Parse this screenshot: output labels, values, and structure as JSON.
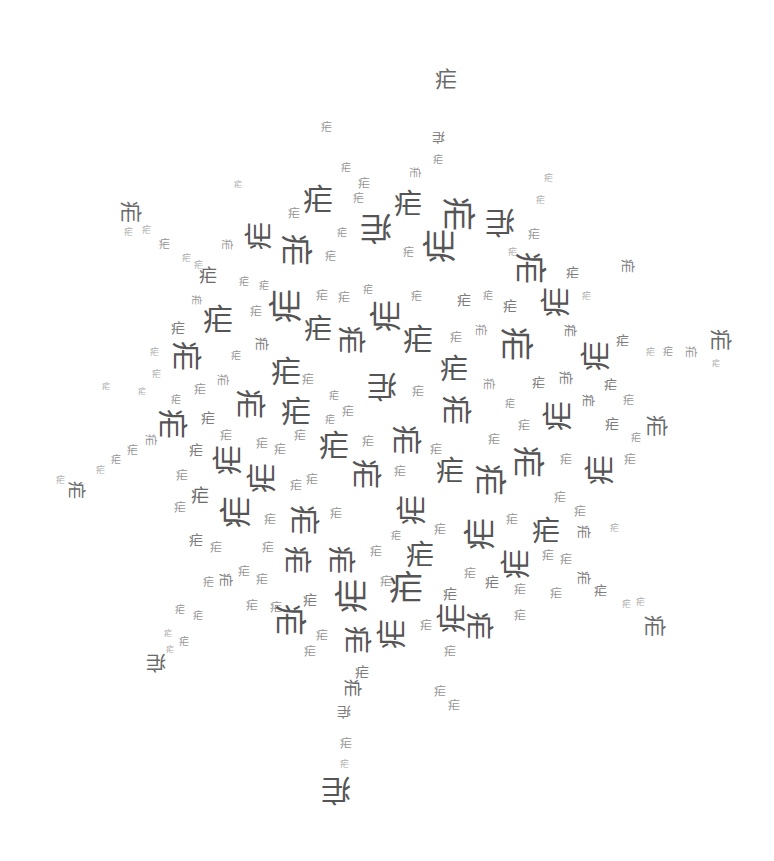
{
  "artwork": {
    "description": "Word-cloud style arrangement of a single repeated Chinese character in a roughly circular cluster with radial spokes",
    "character": "疟",
    "background_color": "#ffffff",
    "ink_colors": [
      "#555555",
      "#6a6a6a",
      "#7d7d7d",
      "#959595",
      "#aaaaaa"
    ]
  },
  "glyphs": [
    {
      "x": 446,
      "y": 80,
      "s": 22,
      "r": 0
    },
    {
      "x": 326,
      "y": 127,
      "s": 11,
      "r": 0
    },
    {
      "x": 438,
      "y": 137,
      "s": 13,
      "r": 180
    },
    {
      "x": 438,
      "y": 160,
      "s": 10,
      "r": 0
    },
    {
      "x": 414,
      "y": 172,
      "s": 11,
      "r": 90
    },
    {
      "x": 346,
      "y": 168,
      "s": 10,
      "r": 0
    },
    {
      "x": 364,
      "y": 184,
      "s": 12,
      "r": 0
    },
    {
      "x": 408,
      "y": 205,
      "s": 28,
      "r": 0
    },
    {
      "x": 358,
      "y": 198,
      "s": 11,
      "r": 0
    },
    {
      "x": 458,
      "y": 214,
      "s": 34,
      "r": 90
    },
    {
      "x": 500,
      "y": 222,
      "s": 30,
      "r": 180
    },
    {
      "x": 548,
      "y": 178,
      "s": 9,
      "r": 0
    },
    {
      "x": 540,
      "y": 200,
      "s": 9,
      "r": 0
    },
    {
      "x": 534,
      "y": 235,
      "s": 12,
      "r": 0
    },
    {
      "x": 130,
      "y": 212,
      "s": 22,
      "r": 90
    },
    {
      "x": 128,
      "y": 232,
      "s": 9,
      "r": 0
    },
    {
      "x": 146,
      "y": 230,
      "s": 9,
      "r": 0
    },
    {
      "x": 164,
      "y": 244,
      "s": 11,
      "r": 0
    },
    {
      "x": 186,
      "y": 258,
      "s": 9,
      "r": 0
    },
    {
      "x": 198,
      "y": 265,
      "s": 9,
      "r": 0
    },
    {
      "x": 238,
      "y": 185,
      "s": 8,
      "r": 0
    },
    {
      "x": 318,
      "y": 200,
      "s": 30,
      "r": 0
    },
    {
      "x": 294,
      "y": 214,
      "s": 12,
      "r": 0
    },
    {
      "x": 260,
      "y": 236,
      "s": 28,
      "r": 270
    },
    {
      "x": 342,
      "y": 233,
      "s": 10,
      "r": 0
    },
    {
      "x": 376,
      "y": 228,
      "s": 32,
      "r": 180
    },
    {
      "x": 330,
      "y": 256,
      "s": 11,
      "r": 0
    },
    {
      "x": 296,
      "y": 250,
      "s": 32,
      "r": 90
    },
    {
      "x": 226,
      "y": 244,
      "s": 11,
      "r": 90
    },
    {
      "x": 440,
      "y": 246,
      "s": 34,
      "r": 270
    },
    {
      "x": 408,
      "y": 252,
      "s": 11,
      "r": 0
    },
    {
      "x": 530,
      "y": 268,
      "s": 32,
      "r": 90
    },
    {
      "x": 512,
      "y": 252,
      "s": 9,
      "r": 0
    },
    {
      "x": 572,
      "y": 272,
      "s": 13,
      "r": 0
    },
    {
      "x": 628,
      "y": 266,
      "s": 14,
      "r": 90
    },
    {
      "x": 208,
      "y": 276,
      "s": 18,
      "r": 0
    },
    {
      "x": 244,
      "y": 282,
      "s": 10,
      "r": 0
    },
    {
      "x": 264,
      "y": 286,
      "s": 10,
      "r": 0
    },
    {
      "x": 196,
      "y": 300,
      "s": 10,
      "r": 90
    },
    {
      "x": 218,
      "y": 320,
      "s": 30,
      "r": 0
    },
    {
      "x": 178,
      "y": 328,
      "s": 14,
      "r": 0
    },
    {
      "x": 256,
      "y": 312,
      "s": 12,
      "r": 0
    },
    {
      "x": 286,
      "y": 306,
      "s": 34,
      "r": 270
    },
    {
      "x": 322,
      "y": 296,
      "s": 12,
      "r": 0
    },
    {
      "x": 344,
      "y": 298,
      "s": 12,
      "r": 0
    },
    {
      "x": 368,
      "y": 290,
      "s": 10,
      "r": 0
    },
    {
      "x": 386,
      "y": 316,
      "s": 32,
      "r": 270
    },
    {
      "x": 416,
      "y": 296,
      "s": 11,
      "r": 0
    },
    {
      "x": 464,
      "y": 300,
      "s": 14,
      "r": 0
    },
    {
      "x": 488,
      "y": 296,
      "s": 10,
      "r": 0
    },
    {
      "x": 510,
      "y": 306,
      "s": 14,
      "r": 0
    },
    {
      "x": 556,
      "y": 302,
      "s": 30,
      "r": 270
    },
    {
      "x": 586,
      "y": 296,
      "s": 9,
      "r": 0
    },
    {
      "x": 570,
      "y": 330,
      "s": 13,
      "r": 90
    },
    {
      "x": 318,
      "y": 330,
      "s": 28,
      "r": 0
    },
    {
      "x": 350,
      "y": 340,
      "s": 28,
      "r": 90
    },
    {
      "x": 262,
      "y": 344,
      "s": 14,
      "r": 90
    },
    {
      "x": 236,
      "y": 356,
      "s": 10,
      "r": 0
    },
    {
      "x": 418,
      "y": 340,
      "s": 30,
      "r": 0
    },
    {
      "x": 456,
      "y": 338,
      "s": 12,
      "r": 0
    },
    {
      "x": 480,
      "y": 330,
      "s": 12,
      "r": 90
    },
    {
      "x": 516,
      "y": 344,
      "s": 34,
      "r": 90
    },
    {
      "x": 596,
      "y": 356,
      "s": 30,
      "r": 270
    },
    {
      "x": 622,
      "y": 340,
      "s": 13,
      "r": 0
    },
    {
      "x": 650,
      "y": 352,
      "s": 9,
      "r": 0
    },
    {
      "x": 668,
      "y": 352,
      "s": 10,
      "r": 0
    },
    {
      "x": 690,
      "y": 352,
      "s": 12,
      "r": 90
    },
    {
      "x": 720,
      "y": 340,
      "s": 22,
      "r": 90
    },
    {
      "x": 716,
      "y": 364,
      "s": 8,
      "r": 0
    },
    {
      "x": 186,
      "y": 356,
      "s": 30,
      "r": 90
    },
    {
      "x": 154,
      "y": 352,
      "s": 9,
      "r": 0
    },
    {
      "x": 156,
      "y": 374,
      "s": 9,
      "r": 0
    },
    {
      "x": 176,
      "y": 400,
      "s": 10,
      "r": 0
    },
    {
      "x": 200,
      "y": 390,
      "s": 12,
      "r": 0
    },
    {
      "x": 222,
      "y": 380,
      "s": 12,
      "r": 90
    },
    {
      "x": 286,
      "y": 372,
      "s": 30,
      "r": 0
    },
    {
      "x": 308,
      "y": 380,
      "s": 12,
      "r": 0
    },
    {
      "x": 250,
      "y": 404,
      "s": 30,
      "r": 90
    },
    {
      "x": 334,
      "y": 396,
      "s": 10,
      "r": 0
    },
    {
      "x": 382,
      "y": 386,
      "s": 30,
      "r": 180
    },
    {
      "x": 454,
      "y": 370,
      "s": 28,
      "r": 0
    },
    {
      "x": 418,
      "y": 392,
      "s": 12,
      "r": 0
    },
    {
      "x": 488,
      "y": 384,
      "s": 12,
      "r": 90
    },
    {
      "x": 538,
      "y": 382,
      "s": 13,
      "r": 0
    },
    {
      "x": 566,
      "y": 378,
      "s": 14,
      "r": 90
    },
    {
      "x": 588,
      "y": 400,
      "s": 13,
      "r": 90
    },
    {
      "x": 610,
      "y": 384,
      "s": 13,
      "r": 0
    },
    {
      "x": 628,
      "y": 400,
      "s": 11,
      "r": 0
    },
    {
      "x": 106,
      "y": 387,
      "s": 8,
      "r": 0
    },
    {
      "x": 142,
      "y": 392,
      "s": 8,
      "r": 0
    },
    {
      "x": 172,
      "y": 424,
      "s": 30,
      "r": 90
    },
    {
      "x": 208,
      "y": 418,
      "s": 14,
      "r": 0
    },
    {
      "x": 226,
      "y": 436,
      "s": 12,
      "r": 0
    },
    {
      "x": 296,
      "y": 412,
      "s": 30,
      "r": 0
    },
    {
      "x": 330,
      "y": 420,
      "s": 10,
      "r": 0
    },
    {
      "x": 348,
      "y": 412,
      "s": 12,
      "r": 0
    },
    {
      "x": 456,
      "y": 410,
      "s": 30,
      "r": 90
    },
    {
      "x": 510,
      "y": 404,
      "s": 10,
      "r": 0
    },
    {
      "x": 524,
      "y": 426,
      "s": 12,
      "r": 0
    },
    {
      "x": 558,
      "y": 416,
      "s": 30,
      "r": 270
    },
    {
      "x": 612,
      "y": 424,
      "s": 14,
      "r": 0
    },
    {
      "x": 636,
      "y": 438,
      "s": 10,
      "r": 0
    },
    {
      "x": 656,
      "y": 426,
      "s": 22,
      "r": 90
    },
    {
      "x": 196,
      "y": 450,
      "s": 14,
      "r": 0
    },
    {
      "x": 150,
      "y": 440,
      "s": 12,
      "r": 90
    },
    {
      "x": 132,
      "y": 450,
      "s": 11,
      "r": 0
    },
    {
      "x": 116,
      "y": 460,
      "s": 10,
      "r": 0
    },
    {
      "x": 100,
      "y": 470,
      "s": 9,
      "r": 0
    },
    {
      "x": 60,
      "y": 480,
      "s": 9,
      "r": 0
    },
    {
      "x": 76,
      "y": 490,
      "s": 18,
      "r": 90
    },
    {
      "x": 228,
      "y": 460,
      "s": 30,
      "r": 270
    },
    {
      "x": 262,
      "y": 444,
      "s": 12,
      "r": 0
    },
    {
      "x": 280,
      "y": 450,
      "s": 12,
      "r": 0
    },
    {
      "x": 300,
      "y": 436,
      "s": 12,
      "r": 0
    },
    {
      "x": 334,
      "y": 446,
      "s": 30,
      "r": 0
    },
    {
      "x": 368,
      "y": 442,
      "s": 12,
      "r": 0
    },
    {
      "x": 406,
      "y": 440,
      "s": 30,
      "r": 90
    },
    {
      "x": 436,
      "y": 450,
      "s": 12,
      "r": 0
    },
    {
      "x": 494,
      "y": 440,
      "s": 12,
      "r": 0
    },
    {
      "x": 528,
      "y": 462,
      "s": 32,
      "r": 90
    },
    {
      "x": 566,
      "y": 460,
      "s": 12,
      "r": 0
    },
    {
      "x": 600,
      "y": 470,
      "s": 30,
      "r": 270
    },
    {
      "x": 630,
      "y": 460,
      "s": 12,
      "r": 0
    },
    {
      "x": 182,
      "y": 476,
      "s": 12,
      "r": 0
    },
    {
      "x": 200,
      "y": 496,
      "s": 18,
      "r": 0
    },
    {
      "x": 262,
      "y": 478,
      "s": 30,
      "r": 270
    },
    {
      "x": 296,
      "y": 486,
      "s": 12,
      "r": 0
    },
    {
      "x": 312,
      "y": 480,
      "s": 12,
      "r": 0
    },
    {
      "x": 366,
      "y": 474,
      "s": 30,
      "r": 90
    },
    {
      "x": 400,
      "y": 472,
      "s": 12,
      "r": 0
    },
    {
      "x": 450,
      "y": 472,
      "s": 28,
      "r": 0
    },
    {
      "x": 490,
      "y": 480,
      "s": 32,
      "r": 90
    },
    {
      "x": 560,
      "y": 498,
      "s": 12,
      "r": 0
    },
    {
      "x": 580,
      "y": 512,
      "s": 12,
      "r": 0
    },
    {
      "x": 180,
      "y": 508,
      "s": 12,
      "r": 0
    },
    {
      "x": 236,
      "y": 512,
      "s": 32,
      "r": 270
    },
    {
      "x": 270,
      "y": 520,
      "s": 12,
      "r": 0
    },
    {
      "x": 304,
      "y": 520,
      "s": 30,
      "r": 90
    },
    {
      "x": 336,
      "y": 514,
      "s": 12,
      "r": 0
    },
    {
      "x": 412,
      "y": 510,
      "s": 30,
      "r": 270
    },
    {
      "x": 440,
      "y": 530,
      "s": 12,
      "r": 0
    },
    {
      "x": 480,
      "y": 534,
      "s": 32,
      "r": 270
    },
    {
      "x": 512,
      "y": 520,
      "s": 12,
      "r": 0
    },
    {
      "x": 546,
      "y": 532,
      "s": 28,
      "r": 0
    },
    {
      "x": 584,
      "y": 532,
      "s": 14,
      "r": 90
    },
    {
      "x": 614,
      "y": 528,
      "s": 9,
      "r": 0
    },
    {
      "x": 196,
      "y": 540,
      "s": 14,
      "r": 0
    },
    {
      "x": 216,
      "y": 548,
      "s": 12,
      "r": 0
    },
    {
      "x": 268,
      "y": 548,
      "s": 12,
      "r": 0
    },
    {
      "x": 296,
      "y": 560,
      "s": 28,
      "r": 90
    },
    {
      "x": 340,
      "y": 560,
      "s": 28,
      "r": 90
    },
    {
      "x": 376,
      "y": 552,
      "s": 12,
      "r": 0
    },
    {
      "x": 396,
      "y": 536,
      "s": 10,
      "r": 0
    },
    {
      "x": 420,
      "y": 556,
      "s": 28,
      "r": 0
    },
    {
      "x": 516,
      "y": 564,
      "s": 30,
      "r": 270
    },
    {
      "x": 548,
      "y": 556,
      "s": 12,
      "r": 0
    },
    {
      "x": 566,
      "y": 560,
      "s": 12,
      "r": 0
    },
    {
      "x": 584,
      "y": 578,
      "s": 14,
      "r": 90
    },
    {
      "x": 600,
      "y": 590,
      "s": 13,
      "r": 0
    },
    {
      "x": 208,
      "y": 582,
      "s": 11,
      "r": 0
    },
    {
      "x": 226,
      "y": 580,
      "s": 14,
      "r": 90
    },
    {
      "x": 244,
      "y": 572,
      "s": 12,
      "r": 0
    },
    {
      "x": 262,
      "y": 580,
      "s": 12,
      "r": 0
    },
    {
      "x": 352,
      "y": 596,
      "s": 34,
      "r": 270
    },
    {
      "x": 386,
      "y": 582,
      "s": 12,
      "r": 0
    },
    {
      "x": 406,
      "y": 588,
      "s": 34,
      "r": 0
    },
    {
      "x": 450,
      "y": 594,
      "s": 14,
      "r": 0
    },
    {
      "x": 470,
      "y": 574,
      "s": 12,
      "r": 0
    },
    {
      "x": 492,
      "y": 582,
      "s": 14,
      "r": 0
    },
    {
      "x": 520,
      "y": 590,
      "s": 12,
      "r": 0
    },
    {
      "x": 556,
      "y": 594,
      "s": 12,
      "r": 0
    },
    {
      "x": 626,
      "y": 604,
      "s": 9,
      "r": 0
    },
    {
      "x": 640,
      "y": 602,
      "s": 9,
      "r": 0
    },
    {
      "x": 654,
      "y": 626,
      "s": 22,
      "r": 90
    },
    {
      "x": 180,
      "y": 610,
      "s": 10,
      "r": 0
    },
    {
      "x": 198,
      "y": 616,
      "s": 10,
      "r": 0
    },
    {
      "x": 252,
      "y": 606,
      "s": 12,
      "r": 0
    },
    {
      "x": 276,
      "y": 608,
      "s": 12,
      "r": 0
    },
    {
      "x": 290,
      "y": 620,
      "s": 32,
      "r": 90
    },
    {
      "x": 310,
      "y": 600,
      "s": 14,
      "r": 0
    },
    {
      "x": 452,
      "y": 618,
      "s": 30,
      "r": 270
    },
    {
      "x": 478,
      "y": 626,
      "s": 28,
      "r": 90
    },
    {
      "x": 520,
      "y": 616,
      "s": 12,
      "r": 0
    },
    {
      "x": 168,
      "y": 634,
      "s": 8,
      "r": 0
    },
    {
      "x": 184,
      "y": 642,
      "s": 10,
      "r": 0
    },
    {
      "x": 322,
      "y": 636,
      "s": 12,
      "r": 0
    },
    {
      "x": 356,
      "y": 640,
      "s": 28,
      "r": 90
    },
    {
      "x": 392,
      "y": 634,
      "s": 30,
      "r": 270
    },
    {
      "x": 426,
      "y": 626,
      "s": 12,
      "r": 0
    },
    {
      "x": 450,
      "y": 652,
      "s": 12,
      "r": 0
    },
    {
      "x": 362,
      "y": 672,
      "s": 14,
      "r": 0
    },
    {
      "x": 156,
      "y": 662,
      "s": 20,
      "r": 180
    },
    {
      "x": 170,
      "y": 650,
      "s": 8,
      "r": 0
    },
    {
      "x": 310,
      "y": 652,
      "s": 12,
      "r": 0
    },
    {
      "x": 440,
      "y": 692,
      "s": 12,
      "r": 0
    },
    {
      "x": 454,
      "y": 706,
      "s": 12,
      "r": 0
    },
    {
      "x": 352,
      "y": 688,
      "s": 18,
      "r": 90
    },
    {
      "x": 344,
      "y": 712,
      "s": 14,
      "r": 180
    },
    {
      "x": 346,
      "y": 744,
      "s": 12,
      "r": 0
    },
    {
      "x": 344,
      "y": 764,
      "s": 9,
      "r": 0
    },
    {
      "x": 336,
      "y": 790,
      "s": 30,
      "r": 180
    }
  ]
}
